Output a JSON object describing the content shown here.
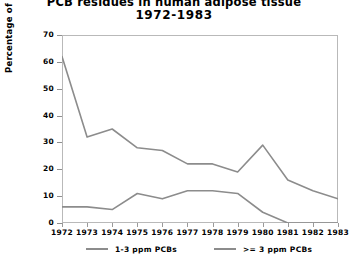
{
  "chart_data": {
    "type": "line",
    "title": "PCB residues in human adipose tissue",
    "subtitle": "1972-1983",
    "xlabel": "",
    "ylabel": "Percentage of population with PCB detected",
    "categories": [
      "1972",
      "1973",
      "1974",
      "1975",
      "1976",
      "1977",
      "1978",
      "1979",
      "1980",
      "1981",
      "1982",
      "1983"
    ],
    "series": [
      {
        "name": "1-3 ppm PCBs",
        "color": "#8c8c8c",
        "values": [
          62,
          32,
          35,
          28,
          27,
          22,
          22,
          19,
          29,
          16,
          12,
          9
        ]
      },
      {
        "name": ">= 3 ppm PCBs",
        "color": "#8c8c8c",
        "values": [
          6,
          6,
          5,
          11,
          9,
          12,
          12,
          11,
          4,
          0,
          0,
          0
        ]
      }
    ],
    "ylim": [
      0,
      70
    ],
    "yticks": [
      0,
      10,
      20,
      30,
      40,
      50,
      60,
      70
    ],
    "grid": false,
    "legend_position": "bottom"
  },
  "legend": {
    "entries": [
      {
        "label": "1-3 ppm PCBs"
      },
      {
        "label": ">= 3 ppm PCBs"
      }
    ]
  },
  "colors": {
    "line": "#8c8c8c",
    "frame": "#b9b9b9",
    "text": "#000000",
    "background": "#ffffff"
  }
}
